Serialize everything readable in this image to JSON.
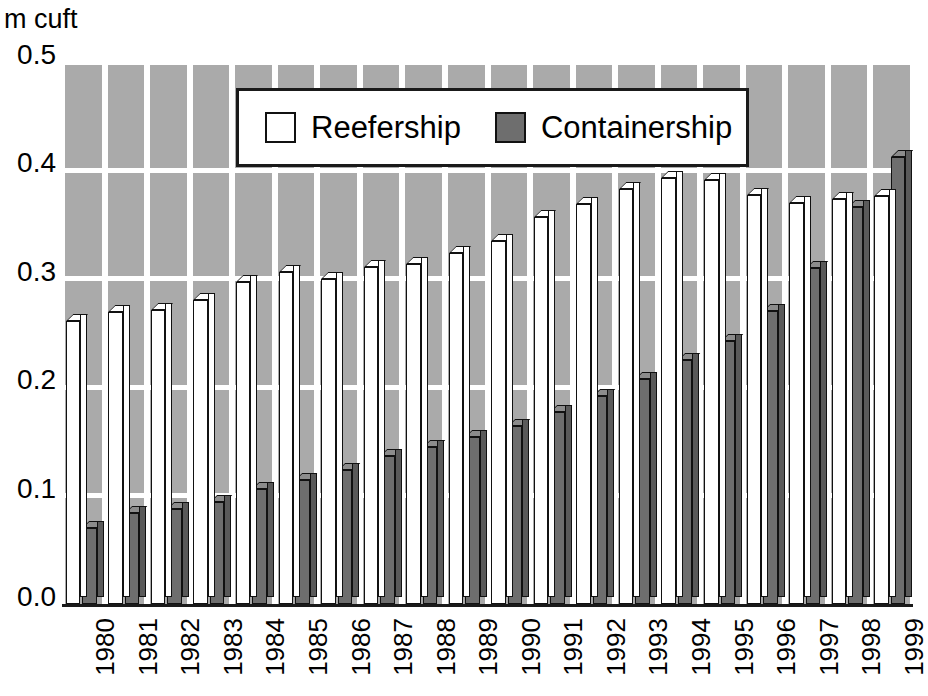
{
  "unit_label": "m cuft",
  "legend": {
    "position": "top-center",
    "entries": [
      {
        "label": "Reefership",
        "swatch": "white",
        "color": "#ffffff"
      },
      {
        "label": "Containership",
        "swatch": "dark",
        "color": "#6e6e6e"
      }
    ]
  },
  "axes": {
    "y_ticks": [
      "0.0",
      "0.1",
      "0.2",
      "0.3",
      "0.4",
      "0.5"
    ],
    "y_values": [
      0.0,
      0.1,
      0.2,
      0.3,
      0.4,
      0.5
    ],
    "x_ticks": [
      "1980",
      "1981",
      "1982",
      "1983",
      "1984",
      "1985",
      "1986",
      "1987",
      "1988",
      "1989",
      "1990",
      "1991",
      "1992",
      "1993",
      "1994",
      "1995",
      "1996",
      "1997",
      "1998",
      "1999"
    ]
  },
  "style": {
    "plot_background": "#aaaaaa",
    "gridline_color": "#ffffff",
    "reefership_color": "#ffffff",
    "containership_color": "#6e6e6e",
    "outline_color": "#111111"
  },
  "chart_data": {
    "type": "bar",
    "title": "",
    "subtitle": "",
    "xlabel": "",
    "ylabel": "m cuft",
    "ylim": [
      0.0,
      0.5
    ],
    "ytick_step": 0.1,
    "grid": true,
    "legend_position": "top-center",
    "categories": [
      "1980",
      "1981",
      "1982",
      "1983",
      "1984",
      "1985",
      "1986",
      "1987",
      "1988",
      "1989",
      "1990",
      "1991",
      "1992",
      "1993",
      "1994",
      "1995",
      "1996",
      "1997",
      "1998",
      "1999"
    ],
    "series": [
      {
        "name": "Reefership",
        "color": "#ffffff",
        "values": [
          0.261,
          0.269,
          0.271,
          0.28,
          0.297,
          0.306,
          0.3,
          0.311,
          0.314,
          0.324,
          0.335,
          0.357,
          0.369,
          0.383,
          0.393,
          0.391,
          0.377,
          0.37,
          0.374,
          0.376
        ]
      },
      {
        "name": "Containership",
        "color": "#6e6e6e",
        "values": [
          0.07,
          0.084,
          0.088,
          0.094,
          0.106,
          0.114,
          0.124,
          0.137,
          0.145,
          0.154,
          0.164,
          0.177,
          0.192,
          0.208,
          0.225,
          0.243,
          0.27,
          0.31,
          0.366,
          0.412
        ]
      }
    ]
  }
}
